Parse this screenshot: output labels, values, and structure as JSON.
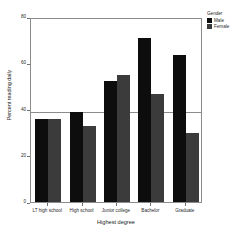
{
  "chart_data": {
    "type": "bar",
    "title": "",
    "xlabel": "Highest degree",
    "ylabel": "Percent reading daily",
    "categories": [
      "LT high school",
      "High school",
      "Junior college",
      "Bachelor",
      "Graduate"
    ],
    "series": [
      {
        "name": "Male",
        "color": "#0d0d0d",
        "values": [
          36,
          39,
          52.5,
          71,
          63.5
        ]
      },
      {
        "name": "Female",
        "color": "#3b3b3b",
        "values": [
          36,
          33,
          55,
          46.5,
          30
        ]
      }
    ],
    "ylim": [
      0,
      80
    ],
    "yticks": [
      0,
      20,
      40,
      60,
      80
    ],
    "ytick_labels": [
      "0",
      "20",
      "40",
      "60",
      "80"
    ],
    "grid": false,
    "reference_line": {
      "value": 40,
      "color": "#8c8c8c"
    },
    "legend": {
      "title": "Gender",
      "position": "right-top",
      "entries": [
        {
          "label": "Male",
          "swatch": "male"
        },
        {
          "label": "Female",
          "swatch": "female"
        }
      ]
    }
  }
}
